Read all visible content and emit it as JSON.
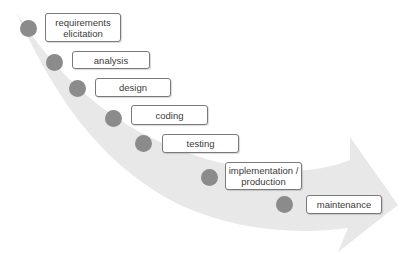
{
  "diagram": {
    "type": "waterfall-arrow",
    "colors": {
      "arrow": "#e8e8e8",
      "dot": "#8b8b8b",
      "box_border": "#7a7a7a",
      "text": "#3a3a3a"
    },
    "stages": [
      {
        "label": "requirements elicitation"
      },
      {
        "label": "analysis"
      },
      {
        "label": "design"
      },
      {
        "label": "coding"
      },
      {
        "label": "testing"
      },
      {
        "label": "implementation / production"
      },
      {
        "label": "maintenance"
      }
    ]
  }
}
